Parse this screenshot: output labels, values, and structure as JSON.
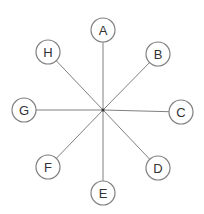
{
  "diagram": {
    "type": "star",
    "center": {
      "x": 103,
      "y": 110
    },
    "node_radius": 12,
    "colors": {
      "stroke": "#808080",
      "text": "#333333",
      "fill": "#ffffff"
    },
    "nodes": [
      {
        "label": "A",
        "x": 103,
        "y": 30
      },
      {
        "label": "B",
        "x": 158,
        "y": 54
      },
      {
        "label": "C",
        "x": 181,
        "y": 112
      },
      {
        "label": "D",
        "x": 158,
        "y": 168
      },
      {
        "label": "E",
        "x": 103,
        "y": 193
      },
      {
        "label": "F",
        "x": 48,
        "y": 167
      },
      {
        "label": "G",
        "x": 24,
        "y": 110
      },
      {
        "label": "H",
        "x": 48,
        "y": 52
      }
    ]
  }
}
